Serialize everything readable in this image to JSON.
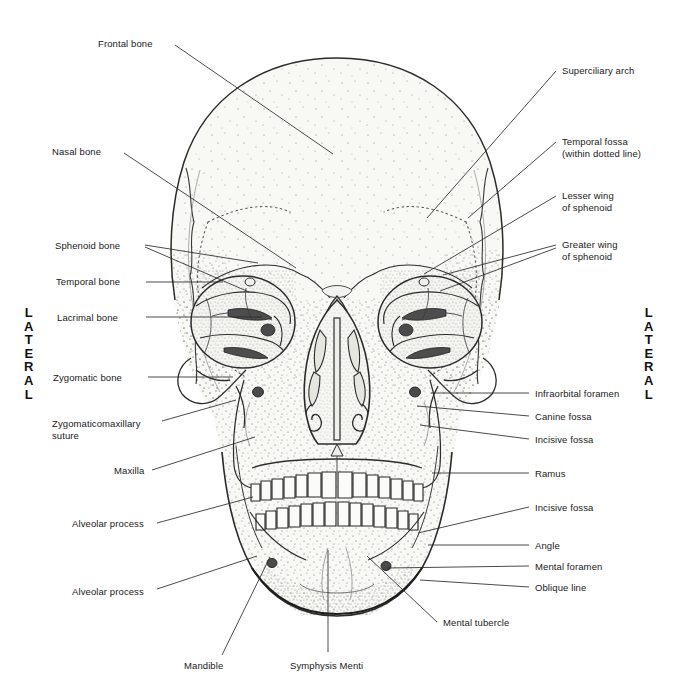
{
  "figure": {
    "orientation_left": "LATERAL",
    "orientation_right": "LATERAL",
    "lateral_letters": [
      "L",
      "A",
      "T",
      "E",
      "R",
      "A",
      "L"
    ]
  },
  "colors": {
    "ink": "#2b2b2b",
    "text": "#1a1a1a",
    "bone_fill": "#f7f7f4",
    "background": "#ffffff"
  },
  "labels_left": [
    {
      "id": "frontal-bone",
      "text": "Frontal bone",
      "x": 98,
      "y": 38,
      "align": "left",
      "leader": [
        [
          175,
          45
        ],
        [
          333,
          154
        ]
      ]
    },
    {
      "id": "nasal-bone",
      "text": "Nasal bone",
      "x": 52,
      "y": 146,
      "align": "left",
      "leader": [
        [
          124,
          153
        ],
        [
          296,
          268
        ]
      ]
    },
    {
      "id": "sphenoid-bone",
      "text": "Sphenoid bone",
      "x": 55,
      "y": 240,
      "align": "left",
      "leader": [
        [
          145,
          245
        ],
        [
          258,
          263
        ]
      ]
    },
    {
      "id": "sphenoid-bone-2",
      "text": "",
      "x": 0,
      "y": 0,
      "align": "left",
      "leader": [
        [
          145,
          247
        ],
        [
          249,
          292
        ]
      ]
    },
    {
      "id": "temporal-bone",
      "text": "Temporal bone",
      "x": 56,
      "y": 276,
      "align": "left",
      "leader": [
        [
          146,
          282
        ],
        [
          223,
          282
        ]
      ]
    },
    {
      "id": "lacrimal-bone",
      "text": "Lacrimal bone",
      "x": 57,
      "y": 312,
      "align": "left",
      "leader": [
        [
          146,
          317
        ],
        [
          262,
          317
        ]
      ]
    },
    {
      "id": "zygomatic-bone",
      "text": "Zygomatic bone",
      "x": 53,
      "y": 372,
      "align": "left",
      "leader": [
        [
          148,
          377
        ],
        [
          233,
          377
        ]
      ]
    },
    {
      "id": "zygomaticomaxillary-suture",
      "text": "Zygomaticomaxillary\nsuture",
      "x": 52,
      "y": 418,
      "align": "left",
      "leader": [
        [
          162,
          421
        ],
        [
          236,
          400
        ]
      ]
    },
    {
      "id": "maxilla",
      "text": "Maxilla",
      "x": 114,
      "y": 465,
      "align": "left",
      "leader": [
        [
          152,
          470
        ],
        [
          255,
          437
        ]
      ]
    },
    {
      "id": "alveolar-process-upper",
      "text": "Alveolar process",
      "x": 72,
      "y": 518,
      "align": "left",
      "leader": [
        [
          157,
          523
        ],
        [
          253,
          497
        ]
      ]
    },
    {
      "id": "alveolar-process-lower",
      "text": "Alveolar process",
      "x": 72,
      "y": 586,
      "align": "left",
      "leader": [
        [
          157,
          589
        ],
        [
          257,
          556
        ]
      ]
    },
    {
      "id": "mandible",
      "text": "Mandible",
      "x": 184,
      "y": 660,
      "align": "left",
      "leader": [
        [
          222,
          655
        ],
        [
          270,
          557
        ]
      ]
    }
  ],
  "labels_right": [
    {
      "id": "superciliary-arch",
      "text": "Superciliary arch",
      "x": 562,
      "y": 65,
      "align": "left",
      "leader": [
        [
          556,
          71
        ],
        [
          427,
          218
        ]
      ]
    },
    {
      "id": "temporal-fossa",
      "text": "Temporal fossa\n(within dotted line)",
      "x": 562,
      "y": 136,
      "align": "left",
      "leader": [
        [
          556,
          142
        ],
        [
          468,
          218
        ]
      ]
    },
    {
      "id": "lesser-wing-of-sphenoid",
      "text": "Lesser wing\nof sphenoid",
      "x": 562,
      "y": 190,
      "align": "left",
      "leader": [
        [
          556,
          196
        ],
        [
          424,
          274
        ]
      ]
    },
    {
      "id": "greater-wing-of-sphenoid",
      "text": "Greater wing\nof sphenoid",
      "x": 562,
      "y": 239,
      "align": "left",
      "leader": [
        [
          556,
          245
        ],
        [
          443,
          275
        ]
      ]
    },
    {
      "id": "greater-wing-of-sphenoid-2",
      "text": "",
      "x": 0,
      "y": 0,
      "align": "left",
      "leader": [
        [
          556,
          248
        ],
        [
          440,
          291
        ]
      ]
    },
    {
      "id": "infraorbital-foramen",
      "text": "Infraorbital foramen",
      "x": 535,
      "y": 388,
      "align": "left",
      "leader": [
        [
          529,
          393
        ],
        [
          431,
          393
        ]
      ]
    },
    {
      "id": "canine-fossa",
      "text": "Canine fossa",
      "x": 535,
      "y": 411,
      "align": "left",
      "leader": [
        [
          529,
          416
        ],
        [
          417,
          406
        ]
      ]
    },
    {
      "id": "incisive-fossa-upper",
      "text": "Incisive fossa",
      "x": 535,
      "y": 434,
      "align": "left",
      "leader": [
        [
          529,
          439
        ],
        [
          420,
          425
        ]
      ]
    },
    {
      "id": "ramus",
      "text": "Ramus",
      "x": 535,
      "y": 468,
      "align": "left",
      "leader": [
        [
          529,
          473
        ],
        [
          432,
          473
        ]
      ]
    },
    {
      "id": "incisive-fossa-lower",
      "text": "Incisive fossa",
      "x": 535,
      "y": 502,
      "align": "left",
      "leader": [
        [
          529,
          507
        ],
        [
          418,
          533
        ]
      ]
    },
    {
      "id": "angle",
      "text": "Angle",
      "x": 535,
      "y": 540,
      "align": "left",
      "leader": [
        [
          529,
          545
        ],
        [
          428,
          545
        ]
      ]
    },
    {
      "id": "mental-foramen",
      "text": "Mental foramen",
      "x": 535,
      "y": 561,
      "align": "left",
      "leader": [
        [
          529,
          566
        ],
        [
          387,
          568
        ]
      ]
    },
    {
      "id": "oblique-line",
      "text": "Oblique line",
      "x": 535,
      "y": 582,
      "align": "left",
      "leader": [
        [
          529,
          587
        ],
        [
          420,
          580
        ]
      ]
    },
    {
      "id": "mental-tubercle",
      "text": "Mental tubercle",
      "x": 443,
      "y": 617,
      "align": "left",
      "leader": [
        [
          437,
          622
        ],
        [
          367,
          556
        ]
      ]
    }
  ],
  "labels_bottom": [
    {
      "id": "symphysis-menti",
      "text": "Symphysis Menti",
      "x": 290,
      "y": 660,
      "align": "left",
      "leader": [
        [
          328,
          652
        ],
        [
          328,
          550
        ]
      ]
    }
  ]
}
